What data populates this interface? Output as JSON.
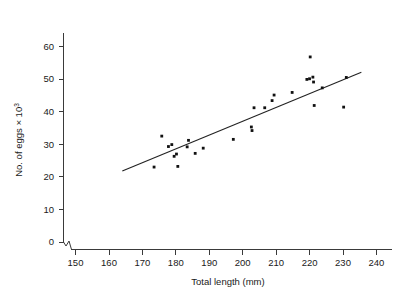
{
  "chart_data": {
    "type": "scatter",
    "title": "",
    "xlabel": "Total length (mm)",
    "ylabel_main": "No. of eggs ",
    "ylabel_times": "× 10",
    "ylabel_exponent": "3",
    "ylabel_full": "No. of eggs × 10³",
    "xlim": [
      145,
      245
    ],
    "ylim": [
      0,
      67
    ],
    "grid": false,
    "legend": "none",
    "axis_break_x": true,
    "xticks": [
      150,
      160,
      170,
      180,
      190,
      200,
      210,
      220,
      230,
      240
    ],
    "xtick_labels": [
      "150",
      "160",
      "170",
      "180",
      "190",
      "200",
      "210",
      "220",
      "230",
      "240"
    ],
    "yticks": [
      0,
      10,
      20,
      30,
      40,
      50,
      60
    ],
    "ytick_labels": [
      "0",
      "10",
      "20",
      "30",
      "40",
      "50",
      "60"
    ],
    "points": [
      {
        "x": 173.5,
        "y": 23.0
      },
      {
        "x": 175.8,
        "y": 32.5
      },
      {
        "x": 177.8,
        "y": 29.3
      },
      {
        "x": 178.8,
        "y": 29.9
      },
      {
        "x": 179.5,
        "y": 26.3
      },
      {
        "x": 180.2,
        "y": 27.0
      },
      {
        "x": 180.6,
        "y": 23.2
      },
      {
        "x": 183.4,
        "y": 29.2
      },
      {
        "x": 183.8,
        "y": 31.2
      },
      {
        "x": 185.8,
        "y": 27.2
      },
      {
        "x": 188.2,
        "y": 28.8
      },
      {
        "x": 197.2,
        "y": 31.5
      },
      {
        "x": 202.6,
        "y": 35.3
      },
      {
        "x": 202.8,
        "y": 34.2
      },
      {
        "x": 203.4,
        "y": 41.2
      },
      {
        "x": 206.6,
        "y": 41.2
      },
      {
        "x": 208.8,
        "y": 43.4
      },
      {
        "x": 209.4,
        "y": 45.1
      },
      {
        "x": 214.8,
        "y": 45.9
      },
      {
        "x": 219.2,
        "y": 49.9
      },
      {
        "x": 220.0,
        "y": 50.1
      },
      {
        "x": 220.2,
        "y": 56.8
      },
      {
        "x": 221.0,
        "y": 50.6
      },
      {
        "x": 221.2,
        "y": 49.1
      },
      {
        "x": 221.4,
        "y": 41.9
      },
      {
        "x": 223.8,
        "y": 47.3
      },
      {
        "x": 230.2,
        "y": 41.4
      },
      {
        "x": 231.0,
        "y": 50.5
      }
    ],
    "fit_line": {
      "type": "linear",
      "x_start": 164.0,
      "y_start": 21.8,
      "x_end": 235.5,
      "y_end": 52.1
    }
  }
}
